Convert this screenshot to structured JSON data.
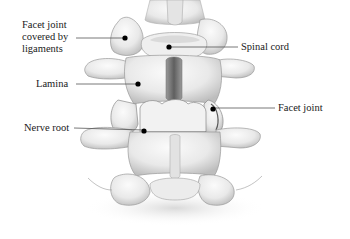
{
  "diagram": {
    "labels": [
      {
        "id": "facet-joint-covered",
        "text_lines": [
          "Facet joint",
          "covered by",
          "ligaments"
        ]
      },
      {
        "id": "spinal-cord",
        "text": "Spinal cord"
      },
      {
        "id": "lamina",
        "text": "Lamina"
      },
      {
        "id": "facet-joint",
        "text": "Facet joint"
      },
      {
        "id": "nerve-root",
        "text": "Nerve root"
      }
    ],
    "colors": {
      "background": "#ffffff",
      "bone_light": "#f4f4f4",
      "bone_mid": "#dcdcdc",
      "bone_shadow": "#a8a8a8",
      "outline": "#8a8a8a",
      "canal_dark": "#6e6e6e",
      "leader_line": "#555555",
      "dot": "#000000",
      "text": "#1a1a1a"
    }
  }
}
